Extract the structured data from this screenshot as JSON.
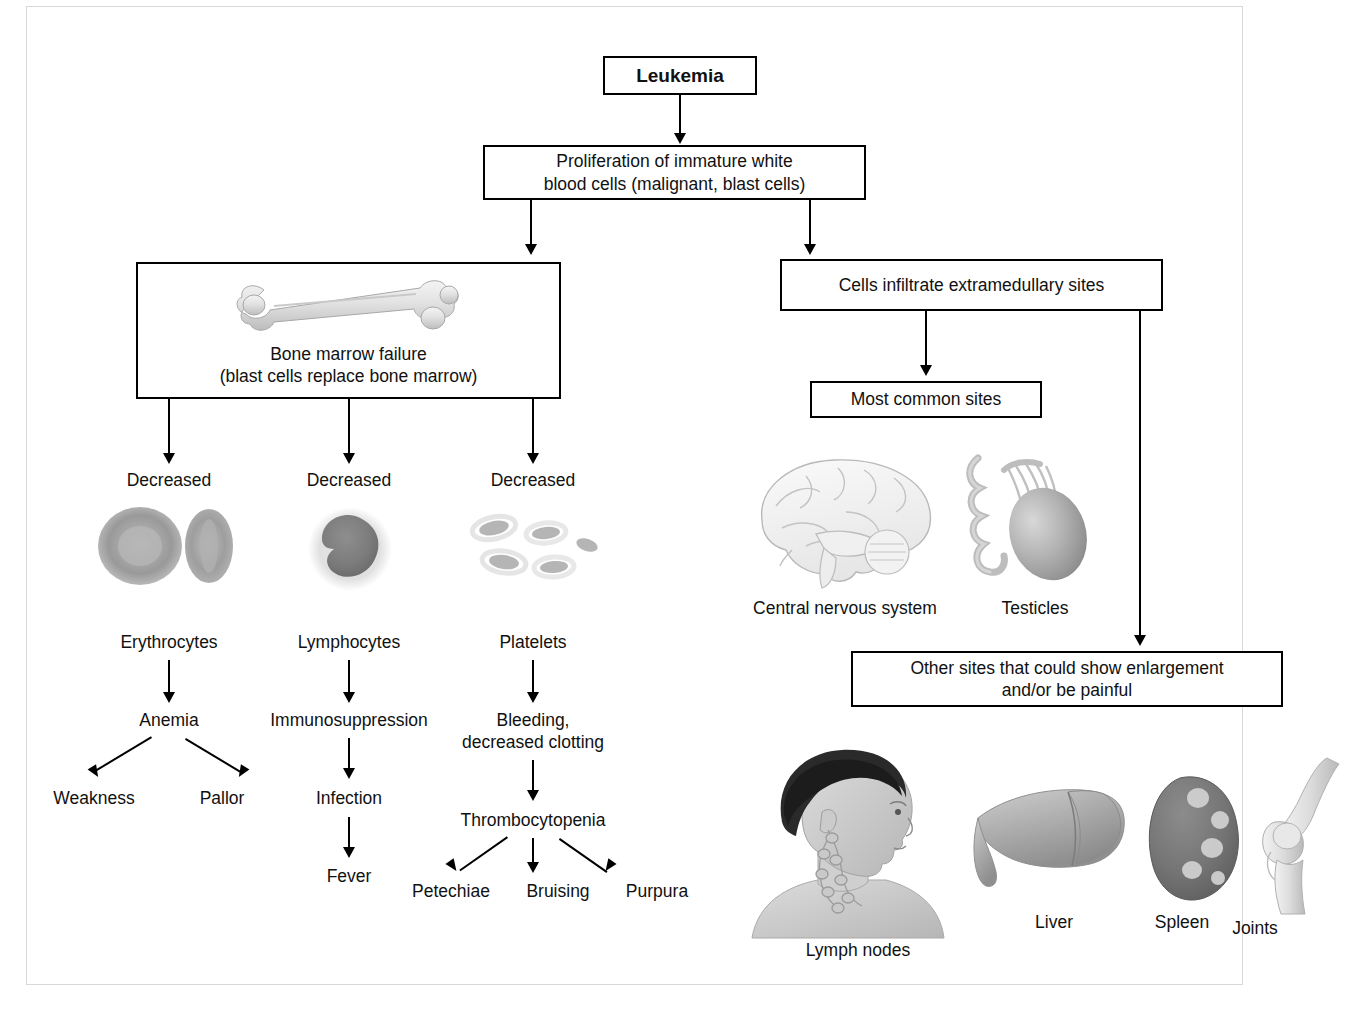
{
  "diagram": {
    "root": {
      "label": "Leukemia"
    },
    "proliferation": {
      "label": "Proliferation of immature white\nblood cells (malignant, blast cells)"
    },
    "left_branch": {
      "bone_marrow": {
        "label": "Bone marrow failure\n(blast cells replace bone marrow)",
        "icon": "long-bone-illustration"
      },
      "columns": [
        {
          "decreased": "Decreased",
          "cell_label": "Erythrocytes",
          "cell_icon": "erythrocyte-illustration",
          "effect": "Anemia",
          "outcomes": [
            "Weakness",
            "Pallor"
          ]
        },
        {
          "decreased": "Decreased",
          "cell_label": "Lymphocytes",
          "cell_icon": "lymphocyte-illustration",
          "effect": "Immunosuppression",
          "outcomes": [
            "Infection",
            "Fever"
          ]
        },
        {
          "decreased": "Decreased",
          "cell_label": "Platelets",
          "cell_icon": "platelets-illustration",
          "effect": "Bleeding,\ndecreased clotting",
          "effect2": "Thrombocytopenia",
          "outcomes": [
            "Petechiae",
            "Bruising",
            "Purpura"
          ]
        }
      ]
    },
    "right_branch": {
      "infiltrate": {
        "label": "Cells infiltrate extramedullary sites"
      },
      "most_common": {
        "label": "Most common sites"
      },
      "common_sites": [
        {
          "label": "Central nervous system",
          "icon": "brain-illustration"
        },
        {
          "label": "Testicles",
          "icon": "testicle-illustration"
        }
      ],
      "other_sites_box": {
        "label": "Other sites that could show enlargement\nand/or be painful"
      },
      "other_sites": [
        {
          "label": "Lymph nodes",
          "icon": "head-neck-lymph-nodes-illustration"
        },
        {
          "label": "Liver",
          "icon": "liver-illustration"
        },
        {
          "label": "Spleen",
          "icon": "spleen-illustration"
        },
        {
          "label": "Joints",
          "icon": "knee-joint-illustration"
        }
      ]
    }
  },
  "colors": {
    "line": "#000000",
    "frame": "#d8d8d8",
    "background": "#ffffff",
    "illustration_gray": "#9a9a9a"
  }
}
